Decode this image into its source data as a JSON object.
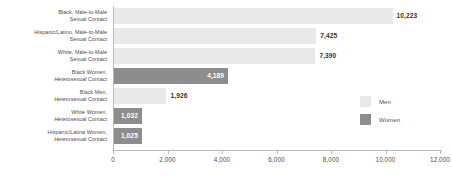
{
  "chart_data": {
    "type": "bar",
    "orientation": "horizontal",
    "title": "",
    "xlabel": "",
    "ylabel": "",
    "xlim": [
      0,
      12000
    ],
    "grid": false,
    "legend_position": "right",
    "tick_labels": [
      "0",
      "2,000",
      "4,000",
      "6,000",
      "8,000",
      "10,000",
      "12,000"
    ],
    "tick_values": [
      0,
      2000,
      4000,
      6000,
      8000,
      10000,
      12000
    ],
    "legend": [
      {
        "name": "Men",
        "color": "#e9e9e9"
      },
      {
        "name": "Women",
        "color": "#8d8d8d"
      }
    ],
    "categories": [
      "Black, Male-to-Male Sexual Contact",
      "Hispanic/Latino, Male-to-Male Sexual Contact",
      "White, Male-to-Male Sexual Contact",
      "Black Women, Heterosexual Contact",
      "Black Men, Heterosexual Contact",
      "White Women, Heterosexual Contact",
      "Hispanic/Latina Women, Heterosexual Contact"
    ],
    "values": [
      10223,
      7425,
      7390,
      4189,
      1926,
      1032,
      1025
    ],
    "bars": [
      {
        "label_line1": "Black, Male-to-Male",
        "label_line2": "Sexual Contact",
        "value": 10223,
        "value_label": "10,223",
        "series": "Men",
        "label_inside": false
      },
      {
        "label_line1": "Hispanic/Latino, Male-to-Male",
        "label_line2": "Sexual Contact",
        "value": 7425,
        "value_label": "7,425",
        "series": "Men",
        "label_inside": false
      },
      {
        "label_line1": "White, Male-to-Male",
        "label_line2": "Sexual Contact",
        "value": 7390,
        "value_label": "7,390",
        "series": "Men",
        "label_inside": false
      },
      {
        "label_line1": "Black Women,",
        "label_line2": "Heterosexual Contact",
        "value": 4189,
        "value_label": "4,189",
        "series": "Women",
        "label_inside": true
      },
      {
        "label_line1": "Black Men,",
        "label_line2": "Heterosexual Contact",
        "value": 1926,
        "value_label": "1,926",
        "series": "Men",
        "label_inside": false
      },
      {
        "label_line1": "White Women,",
        "label_line2": "Heterosexual Contact",
        "value": 1032,
        "value_label": "1,032",
        "series": "Women",
        "label_inside": true
      },
      {
        "label_line1": "Hispanic/Latina Women,",
        "label_line2": "Heterosexual Contact",
        "value": 1025,
        "value_label": "1,025",
        "series": "Women",
        "label_inside": true
      }
    ]
  }
}
